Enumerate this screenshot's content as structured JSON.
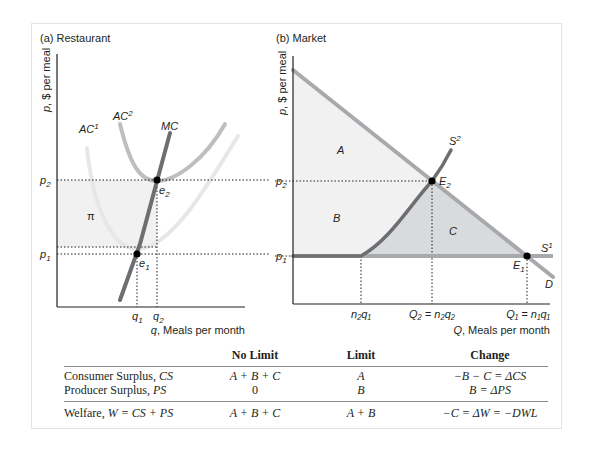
{
  "panel_a": {
    "title": "(a) Restaurant",
    "y_axis_label": "p, $ per meal",
    "x_axis_label": "q, Meals per month",
    "curves": {
      "ac1": {
        "base": "AC",
        "sup": "1"
      },
      "ac2": {
        "base": "AC",
        "sup": "2"
      },
      "mc": "MC"
    },
    "price_ticks": [
      {
        "base": "p",
        "sub": "2"
      },
      {
        "base": "p",
        "sub": "1"
      }
    ],
    "quantity_ticks": [
      {
        "base": "q",
        "sub": "1"
      },
      {
        "base": "q",
        "sub": "2"
      }
    ],
    "points": [
      {
        "base": "e",
        "sub": "2"
      },
      {
        "base": "e",
        "sub": "1"
      }
    ],
    "profit_area_label": "π"
  },
  "panel_b": {
    "title": "(b) Market",
    "y_axis_label": "p, $ per meal",
    "x_axis_label": "Q, Meals per month",
    "curves": {
      "s2": {
        "base": "S",
        "sup": "2"
      },
      "s1": {
        "base": "S",
        "sup": "1"
      },
      "d": "D"
    },
    "price_ticks": [
      {
        "base": "p",
        "sub": "2"
      },
      {
        "base": "p",
        "sub": "1"
      }
    ],
    "quantity_ticks": [
      {
        "text": "n₂q₁"
      },
      {
        "text": "Q₂ = n₂q₂"
      },
      {
        "text": "Q₁ = n₁q₁"
      }
    ],
    "points": [
      {
        "base": "E",
        "sub": "2"
      },
      {
        "base": "E",
        "sub": "1"
      }
    ],
    "areas": [
      "A",
      "B",
      "C"
    ]
  },
  "colors": {
    "axis": "#231f20",
    "mc": "#6d6e71",
    "ac2": "#bcbec0",
    "ac1": "#e6e7e8",
    "demand": "#a7a9ac",
    "supply": "#6d6e71",
    "shade_light": "#f1f1f2",
    "shade_dark": "#d9dadb",
    "frame": "#e4e4e4"
  },
  "table": {
    "headers": [
      "",
      "No Limit",
      "Limit",
      "Change"
    ],
    "rows": [
      {
        "label": "Consumer Surplus, ",
        "label_var": "CS",
        "no_limit": "A + B + C",
        "limit": "A",
        "change": "−B − C = ΔCS"
      },
      {
        "label": "Producer Surplus, ",
        "label_var": "PS",
        "no_limit": "0",
        "limit": "B",
        "change": "B = ΔPS"
      },
      {
        "label": "Welfare, ",
        "label_var": "W = CS + PS",
        "no_limit": "A + B + C",
        "limit": "A + B",
        "change": "−C = ΔW = −DWL"
      }
    ]
  }
}
